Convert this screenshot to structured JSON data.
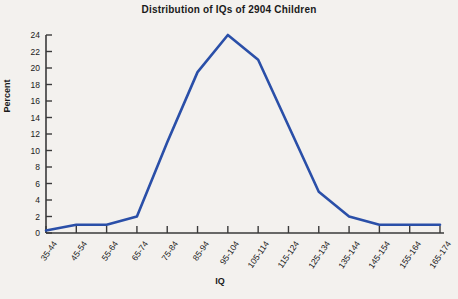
{
  "chart_data": {
    "type": "line",
    "title": "Distribution of IQs of 2904 Children",
    "xlabel": "IQ",
    "ylabel": "Percent",
    "categories": [
      "35-44",
      "45-54",
      "55-64",
      "65-74",
      "75-84",
      "85-94",
      "95-104",
      "105-114",
      "115-124",
      "125-134",
      "135-144",
      "145-154",
      "155-164",
      "165-174"
    ],
    "values": [
      0.3,
      1.0,
      1.0,
      2.0,
      11.0,
      19.5,
      24.0,
      21.0,
      13.0,
      5.0,
      2.0,
      1.0,
      1.0,
      1.0
    ],
    "ylim": [
      0,
      24
    ],
    "yticks": [
      0,
      2,
      4,
      6,
      8,
      10,
      12,
      14,
      16,
      18,
      20,
      22,
      24
    ],
    "grid": false,
    "legend": "none",
    "line_color": "#2a4fa8",
    "axis_color": "#3a3a3a",
    "background_color": "#f3f1ee"
  }
}
